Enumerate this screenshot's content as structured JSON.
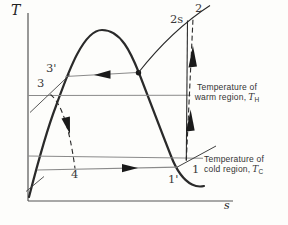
{
  "figure": {
    "colors": {
      "ink": "#2a2a2a",
      "guide_line": "#8a8a8a",
      "paper": "#fdfdfb",
      "text": "#3a3a3a"
    }
  },
  "axes": {
    "y_label": "T",
    "x_label": "s"
  },
  "points": {
    "p1": {
      "label": "1"
    },
    "p1p": {
      "label": "1'"
    },
    "p2": {
      "label": "2"
    },
    "p2s": {
      "label": "2s"
    },
    "p3": {
      "label": "3"
    },
    "p3p": {
      "label": "3'"
    },
    "p4": {
      "label": "4"
    }
  },
  "annotations": {
    "warm": {
      "line1": "Temperature of",
      "line2": "warm region,",
      "symbol": "T",
      "subscript": "H"
    },
    "cold": {
      "line1": "Temperature of",
      "line2": "cold region,",
      "symbol": "T",
      "subscript": "C"
    }
  }
}
